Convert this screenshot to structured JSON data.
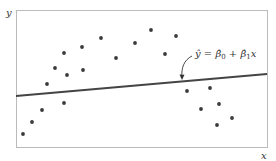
{
  "chart_data": {
    "type": "scatter",
    "title": "",
    "xlabel": "x",
    "ylabel": "y",
    "grid": false,
    "legend": null,
    "frame": {
      "left": 16,
      "top": 10,
      "right": 267,
      "bottom": 147
    },
    "points_px": [
      [
        23,
        134
      ],
      [
        32,
        122
      ],
      [
        42,
        110
      ],
      [
        47,
        84
      ],
      [
        55,
        68
      ],
      [
        64,
        53
      ],
      [
        64,
        103
      ],
      [
        67,
        75
      ],
      [
        82,
        47
      ],
      [
        83,
        70
      ],
      [
        101,
        38
      ],
      [
        116,
        58
      ],
      [
        135,
        43
      ],
      [
        151,
        30
      ],
      [
        165,
        54
      ],
      [
        176,
        36
      ],
      [
        187,
        91
      ],
      [
        201,
        109
      ],
      [
        210,
        88
      ],
      [
        217,
        125
      ],
      [
        219,
        104
      ],
      [
        232,
        118
      ]
    ],
    "regression_line_px": {
      "x1": 16,
      "y1": 96,
      "x2": 267,
      "y2": 74
    },
    "annotation": {
      "text": "ŷ = β̂0 + β̂1x",
      "points_to": "regression line"
    },
    "colors": {
      "points": "#3a3a3a",
      "line": "#444444",
      "frame": "#bbbbbb",
      "text": "#333333"
    }
  },
  "labels": {
    "x_axis": "x",
    "y_axis": "y",
    "eq_yhat": "ŷ",
    "eq_equals": " = ",
    "eq_beta0": "β̂",
    "eq_sub0": "0",
    "eq_plus": " + ",
    "eq_beta1": "β̂",
    "eq_sub1": "1",
    "eq_x": "x"
  }
}
